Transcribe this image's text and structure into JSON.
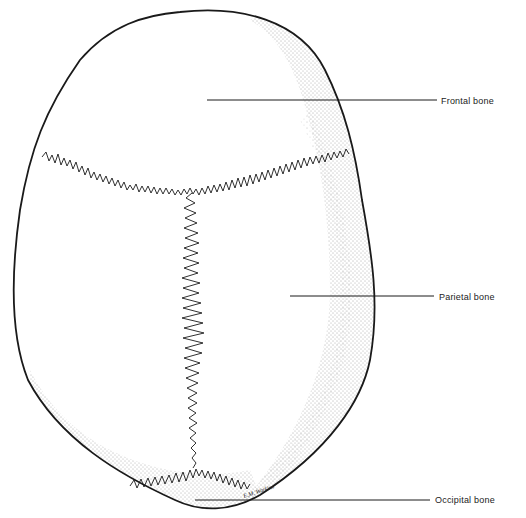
{
  "diagram": {
    "labels": [
      {
        "id": "frontal",
        "text": "Frontal bone"
      },
      {
        "id": "parietal",
        "text": "Parietal bone"
      },
      {
        "id": "occipital",
        "text": "Occipital bone"
      }
    ],
    "signature": "E.M. Watkins",
    "colors": {
      "ink": "#1a1a1a",
      "background": "#ffffff"
    }
  }
}
